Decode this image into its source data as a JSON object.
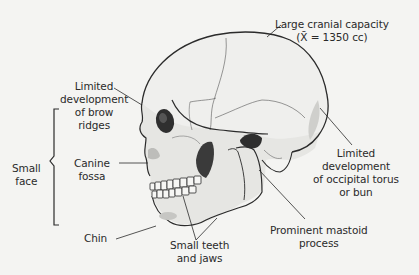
{
  "figure": {
    "labels": {
      "cranial_capacity": {
        "line1": "Large cranial capacity",
        "line2": "(X̄ = 1350 cc)"
      },
      "brow_ridges": {
        "line1": "Limited",
        "line2": "development",
        "line3": "of brow",
        "line4": "ridges"
      },
      "small_face": {
        "line1": "Small",
        "line2": "face"
      },
      "canine_fossa": {
        "line1": "Canine",
        "line2": "fossa"
      },
      "chin": {
        "line1": "Chin"
      },
      "teeth_jaws": {
        "line1": "Small teeth",
        "line2": "and jaws"
      },
      "mastoid": {
        "line1": "Prominent mastoid",
        "line2": "process"
      },
      "occipital": {
        "line1": "Limited",
        "line2": "development",
        "line3": "of occipital torus",
        "line4": "or bun"
      }
    },
    "colors": {
      "background": "#f4f4f2",
      "text": "#2a2a2a",
      "outline": "#2b2b2b",
      "bone": "#ececea",
      "shadow": "#3a3a3a"
    }
  }
}
